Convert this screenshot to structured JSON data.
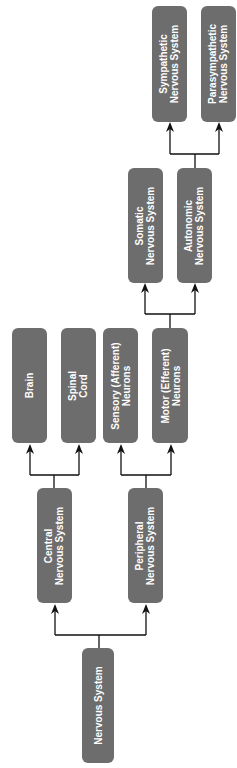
{
  "diagram": {
    "type": "tree",
    "orientation": "rotated-90-ccw (root at bottom, children toward top)",
    "colors": {
      "node_fill": "#6d6d6d",
      "node_text": "#ffffff",
      "connector": "#111111"
    },
    "nodes": {
      "nervous_system": {
        "lines": [
          "Nervous System"
        ]
      },
      "central": {
        "lines": [
          "Central",
          "Nervous System"
        ]
      },
      "peripheral": {
        "lines": [
          "Peripheral",
          "Nervous System"
        ]
      },
      "brain": {
        "lines": [
          "Brain"
        ]
      },
      "spinal_cord": {
        "lines": [
          "Spinal",
          "Cord"
        ]
      },
      "sensory": {
        "lines": [
          "Sensory (Afferent)",
          "Neurons"
        ]
      },
      "motor": {
        "lines": [
          "Motor (Efferent)",
          "Neurons"
        ]
      },
      "somatic": {
        "lines": [
          "Somatic",
          "Nervous System"
        ]
      },
      "autonomic": {
        "lines": [
          "Autonomic",
          "Nervous System"
        ]
      },
      "sympathetic": {
        "lines": [
          "Sympathetic",
          "Nervous System"
        ]
      },
      "parasympathetic": {
        "lines": [
          "Parasympathetic",
          "Nervous System"
        ]
      }
    },
    "edges": [
      [
        "Nervous System",
        "Central Nervous System"
      ],
      [
        "Nervous System",
        "Peripheral Nervous System"
      ],
      [
        "Central Nervous System",
        "Brain"
      ],
      [
        "Central Nervous System",
        "Spinal Cord"
      ],
      [
        "Peripheral Nervous System",
        "Sensory (Afferent) Neurons"
      ],
      [
        "Peripheral Nervous System",
        "Motor (Efferent) Neurons"
      ],
      [
        "Motor (Efferent) Neurons",
        "Somatic Nervous System"
      ],
      [
        "Motor (Efferent) Neurons",
        "Autonomic Nervous System"
      ],
      [
        "Autonomic Nervous System",
        "Sympathetic Nervous System"
      ],
      [
        "Autonomic Nervous System",
        "Parasympathetic Nervous System"
      ]
    ]
  }
}
